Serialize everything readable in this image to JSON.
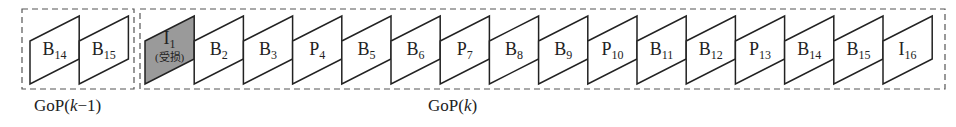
{
  "diagram": {
    "type": "video frame sequence (GoP)",
    "colors": {
      "stroke": "#222222",
      "damaged_fill": "#9a9a9a",
      "normal_fill": "#ffffff",
      "dash": "#555555"
    },
    "groups": [
      {
        "id": "gop-k-minus-1",
        "caption_main": "GoP(",
        "caption_var": "k",
        "caption_tail": "−1)",
        "frames": [
          {
            "type": "B",
            "index": "14",
            "damaged": false
          },
          {
            "type": "B",
            "index": "15",
            "damaged": false
          }
        ]
      },
      {
        "id": "gop-k",
        "caption_main": "GoP(",
        "caption_var": "k",
        "caption_tail": ")",
        "frames": [
          {
            "type": "I",
            "index": "1",
            "damaged": true,
            "note": "(受损)"
          },
          {
            "type": "B",
            "index": "2",
            "damaged": false
          },
          {
            "type": "B",
            "index": "3",
            "damaged": false
          },
          {
            "type": "P",
            "index": "4",
            "damaged": false
          },
          {
            "type": "B",
            "index": "5",
            "damaged": false
          },
          {
            "type": "B",
            "index": "6",
            "damaged": false
          },
          {
            "type": "P",
            "index": "7",
            "damaged": false
          },
          {
            "type": "B",
            "index": "8",
            "damaged": false
          },
          {
            "type": "B",
            "index": "9",
            "damaged": false
          },
          {
            "type": "P",
            "index": "10",
            "damaged": false
          },
          {
            "type": "B",
            "index": "11",
            "damaged": false
          },
          {
            "type": "B",
            "index": "12",
            "damaged": false
          },
          {
            "type": "P",
            "index": "13",
            "damaged": false
          },
          {
            "type": "B",
            "index": "14",
            "damaged": false
          },
          {
            "type": "B",
            "index": "15",
            "damaged": false
          },
          {
            "type": "I",
            "index": "16",
            "damaged": false
          }
        ]
      }
    ]
  }
}
